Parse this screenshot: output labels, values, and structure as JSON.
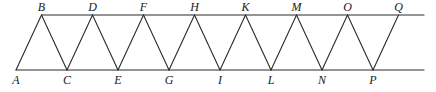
{
  "diagram": {
    "top_points": [
      "B",
      "D",
      "F",
      "H",
      "K",
      "M",
      "O",
      "Q"
    ],
    "bottom_points": [
      "A",
      "C",
      "E",
      "G",
      "I",
      "L",
      "N",
      "P"
    ],
    "zigzag_order": [
      "A",
      "B",
      "C",
      "D",
      "E",
      "F",
      "G",
      "H",
      "I",
      "K",
      "L",
      "M",
      "N",
      "O",
      "P",
      "Q"
    ],
    "lines": [
      {
        "name": "top-parallel-line",
        "from": "B",
        "extends_right": true
      },
      {
        "name": "bottom-parallel-line",
        "from": "A",
        "extends_right": true
      }
    ],
    "colors": {
      "line": "#2a2a2a",
      "label": "#1a1a1a",
      "background": "#ffffff"
    }
  }
}
